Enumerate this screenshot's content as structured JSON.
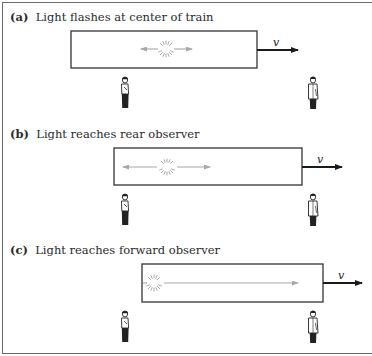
{
  "figure": {
    "panels": [
      {
        "id": "a",
        "label": "(a)",
        "caption": "Light flashes at center of train",
        "velocity_label": "v"
      },
      {
        "id": "b",
        "label": "(b)",
        "caption": "Light reaches rear observer",
        "velocity_label": "v"
      },
      {
        "id": "c",
        "label": "(c)",
        "caption": "Light reaches forward observer",
        "velocity_label": "v"
      }
    ],
    "colors": {
      "frame": "#6a6a6a",
      "train_outline": "#333333",
      "light_ray": "#a8a8a8",
      "velocity_arrow": "#1a1a1a",
      "observer": "#222222"
    }
  }
}
